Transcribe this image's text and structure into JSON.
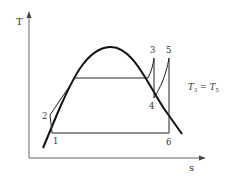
{
  "diagram": {
    "axes": {
      "y_label": "T",
      "x_label": "s"
    },
    "points": [
      {
        "id": "1",
        "label": "1"
      },
      {
        "id": "2",
        "label": "2"
      },
      {
        "id": "3",
        "label": "3"
      },
      {
        "id": "4",
        "label": "4"
      },
      {
        "id": "5",
        "label": "5"
      },
      {
        "id": "6",
        "label": "6"
      }
    ],
    "annotation": {
      "lhs": "T",
      "lhs_sub": "3",
      "eq": " = ",
      "rhs": "T",
      "rhs_sub": "5"
    },
    "colors": {
      "line": "#222222",
      "dome": "#111111",
      "axis": "#555555",
      "text": "#333333"
    }
  }
}
